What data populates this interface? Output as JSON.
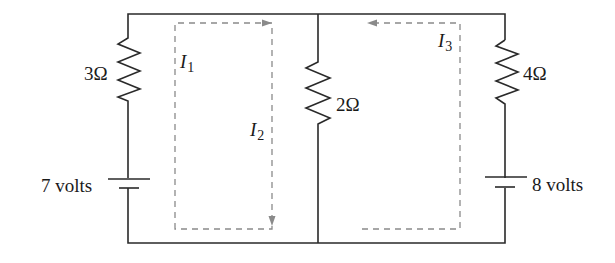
{
  "diagram": {
    "type": "circuit",
    "colors": {
      "wire": "#2a2a2a",
      "loop": "#8a8a8a",
      "text": "#1a1a1a",
      "background": "#ffffff"
    },
    "components": {
      "r1": {
        "label": "3Ω",
        "resistance_ohm": 3,
        "branch": "left"
      },
      "r2": {
        "label": "2Ω",
        "resistance_ohm": 2,
        "branch": "middle"
      },
      "r3": {
        "label": "4Ω",
        "resistance_ohm": 4,
        "branch": "right"
      },
      "v1": {
        "label": "7 volts",
        "voltage_v": 7,
        "branch": "left"
      },
      "v2": {
        "label": "8 volts",
        "voltage_v": 8,
        "branch": "right"
      }
    },
    "currents": [
      {
        "symbol": "I",
        "subscript": "1",
        "loop": "left",
        "direction": "clockwise"
      },
      {
        "symbol": "I",
        "subscript": "2",
        "loop": "left",
        "direction": "clockwise"
      },
      {
        "symbol": "I",
        "subscript": "3",
        "loop": "right",
        "direction": "counterclockwise"
      }
    ]
  }
}
